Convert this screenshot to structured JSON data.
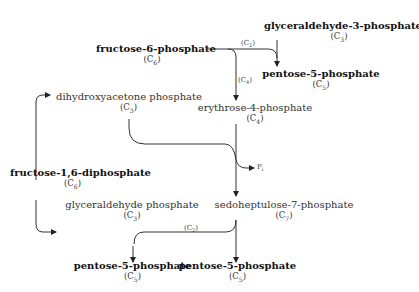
{
  "diagram": {
    "type": "pentose phosphate pathway scheme",
    "nodes": {
      "g3p_top": {
        "name": "glyceraldehyde-3-phosphate",
        "carbon": "C",
        "sub": "3"
      },
      "f6p": {
        "name": "fructose-6-phosphate",
        "carbon": "C",
        "sub": "6"
      },
      "p5p_top": {
        "name": "pentose-5-phosphate",
        "carbon": "C",
        "sub": "5"
      },
      "dhap": {
        "name": "dihydroxyacetone phosphate",
        "carbon": "C",
        "sub": "3"
      },
      "e4p": {
        "name": "erythrose-4-phosphate",
        "carbon": "C",
        "sub": "4"
      },
      "f16dp": {
        "name": "fructose-1,6-diphosphate",
        "carbon": "C",
        "sub": "6"
      },
      "gap": {
        "name": "glyceraldehyde phosphate",
        "carbon": "C",
        "sub": "3"
      },
      "s7p": {
        "name": "sedoheptulose-7-phosphate",
        "carbon": "C",
        "sub": "7"
      },
      "p5p_left": {
        "name": "pentose-5-phosphate",
        "carbon": "C",
        "sub": "5"
      },
      "p5p_right": {
        "name": "pentose-5-phosphate",
        "carbon": "C",
        "sub": "5"
      }
    },
    "edge_labels": {
      "c2_top": {
        "c": "(C",
        "sub": "2",
        "end": ")"
      },
      "c4": {
        "c": "(C",
        "sub": "4",
        "end": ")"
      },
      "c2_bottom": {
        "c": "(C",
        "sub": "2",
        "end": ")"
      },
      "pi": {
        "c": "P",
        "sub": "i",
        "end": ""
      }
    }
  }
}
